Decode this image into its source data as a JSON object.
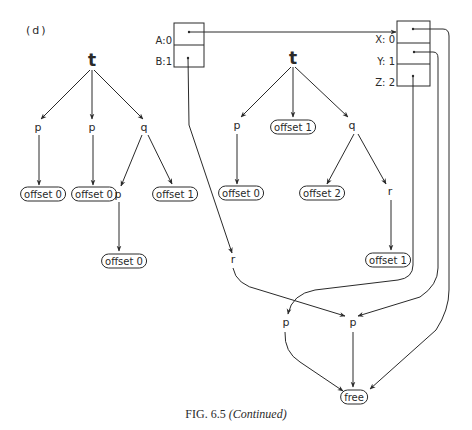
{
  "figure": {
    "part_label": "(d)",
    "caption_prefix": "FIG. 6.5 ",
    "caption_suffix": "(Continued)"
  },
  "left_tree": {
    "root": "t",
    "children": [
      {
        "label": "p",
        "leaf": "offset 0"
      },
      {
        "label": "p",
        "leaf": "offset 0"
      },
      {
        "label": "q",
        "children": [
          {
            "label": "p",
            "leaf": "offset 0"
          },
          {
            "leaf": "offset 1"
          }
        ]
      }
    ]
  },
  "box_ab": {
    "slots": [
      {
        "name": "A",
        "index": "0",
        "text": "A:0"
      },
      {
        "name": "B",
        "index": "1",
        "text": "B:1"
      }
    ]
  },
  "middle_tree": {
    "root": "t",
    "children": [
      {
        "label": "p",
        "leaf": "offset 0"
      },
      {
        "leaf": "offset 1"
      },
      {
        "label": "q",
        "children": [
          {
            "leaf": "offset 2"
          },
          {
            "label": "r",
            "leaf": "offset 1"
          }
        ]
      }
    ]
  },
  "box_xyz": {
    "slots": [
      {
        "name": "X",
        "index": "0",
        "text": "X: 0"
      },
      {
        "name": "Y",
        "index": "1",
        "text": "Y: 1"
      },
      {
        "name": "Z",
        "index": "2",
        "text": "Z: 2"
      }
    ]
  },
  "bottom_graph": {
    "r_node": "r",
    "p_left": "p",
    "p_right": "p",
    "free": "free"
  },
  "edges": [
    {
      "from": "A slot",
      "to": "X box"
    },
    {
      "from": "B slot",
      "to": "r"
    },
    {
      "from": "r",
      "to": "p (right)"
    },
    {
      "from": "X slot",
      "to": "free"
    },
    {
      "from": "Y slot",
      "to": "p (right)"
    },
    {
      "from": "Z slot",
      "to": "p (left)"
    },
    {
      "from": "p (left)",
      "to": "free"
    },
    {
      "from": "p (right)",
      "to": "free"
    }
  ]
}
